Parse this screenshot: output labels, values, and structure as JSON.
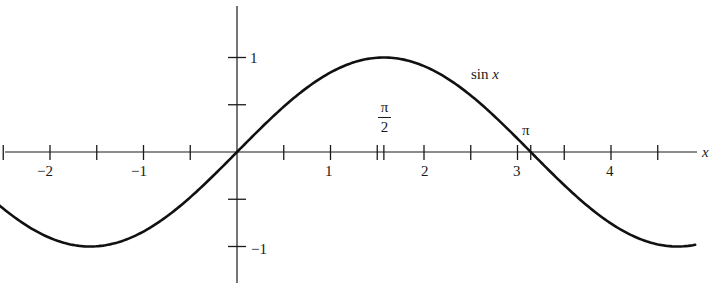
{
  "chart_data": {
    "type": "line",
    "title": "",
    "xlabel": "x",
    "ylabel": "",
    "xlim": [
      -2.5,
      4.9
    ],
    "ylim": [
      -1.3,
      1.6
    ],
    "grid": false,
    "legend": null,
    "annotations": [
      {
        "text": "sin x",
        "x": 2.6,
        "y": 0.85
      },
      {
        "text": "π/2",
        "x": 1.5708,
        "y": 0.25
      },
      {
        "text": "π",
        "x": 3.1416,
        "y": 0.1
      }
    ],
    "x_ticks": [
      -2.5,
      -2,
      -1.5,
      -1,
      -0.5,
      0,
      0.5,
      1,
      1.5,
      1.5708,
      2,
      2.5,
      3,
      3.1416,
      3.5,
      4,
      4.5
    ],
    "x_tick_labels": [
      {
        "value": -2,
        "label": "−2"
      },
      {
        "value": -1,
        "label": "−1"
      },
      {
        "value": 1,
        "label": "1"
      },
      {
        "value": 2,
        "label": "2"
      },
      {
        "value": 3,
        "label": "3"
      },
      {
        "value": 4,
        "label": "4"
      }
    ],
    "y_ticks": [
      -1,
      -0.5,
      0.5,
      1
    ],
    "y_tick_labels": [
      {
        "value": 1,
        "label": "1"
      },
      {
        "value": -1,
        "label": "−1"
      }
    ],
    "series": [
      {
        "name": "sin x",
        "function": "sin(x)",
        "x_range": [
          -2.55,
          4.9
        ],
        "x": [
          -2.5,
          -2,
          -1.5708,
          -1,
          -0.5,
          0,
          0.5,
          1,
          1.5708,
          2,
          2.5,
          3,
          3.1416,
          3.5,
          4,
          4.5,
          4.7124
        ],
        "y": [
          -0.598,
          -0.909,
          -1,
          -0.841,
          -0.479,
          0,
          0.479,
          0.841,
          1,
          0.909,
          0.598,
          0.141,
          0,
          -0.351,
          -0.757,
          -0.978,
          -1
        ]
      }
    ]
  },
  "labels": {
    "x_axis": "x",
    "curve": "sin x",
    "sin": "sin",
    "x_var": "x",
    "pi_num": "π",
    "pi_den": "2",
    "pi": "π",
    "xt_m2": "−2",
    "xt_m1": "−1",
    "xt_1": "1",
    "xt_2": "2",
    "xt_3": "3",
    "xt_4": "4",
    "yt_1": "1",
    "yt_m1": "−1"
  }
}
